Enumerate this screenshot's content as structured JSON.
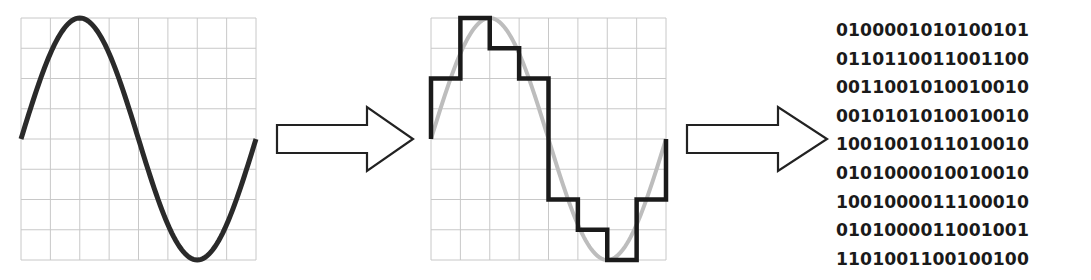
{
  "diagram": {
    "stages": [
      {
        "id": "analog",
        "label": "Analog signal (sine wave)"
      },
      {
        "id": "sampled",
        "label": "Sampled / quantized signal (staircase over sine)"
      },
      {
        "id": "binary",
        "label": "Binary data"
      }
    ],
    "grid": {
      "columns": 8,
      "rows": 8,
      "color": "#c8c8c8"
    },
    "colors": {
      "signal": "#2a2a2a",
      "reference_sine": "#bdbdbd",
      "staircase": "#1a1a1a",
      "arrow_stroke": "#222222",
      "arrow_fill": "#ffffff"
    },
    "staircase_levels": [
      2,
      4,
      3,
      2,
      -2,
      -3,
      -4,
      -2
    ],
    "binary_rows": [
      "0100001010100101",
      "0110110011001100",
      "0011001010010010",
      "0010101010010010",
      "1001001011010010",
      "0101000010010010",
      "1001000011100010",
      "0101000011001001",
      "1101001100100100"
    ]
  }
}
